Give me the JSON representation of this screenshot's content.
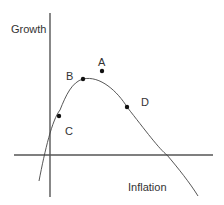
{
  "diagram": {
    "axes": {
      "y_label": "Growth",
      "x_label": "Inflation"
    },
    "points": [
      {
        "label": "A"
      },
      {
        "label": "B"
      },
      {
        "label": "C"
      },
      {
        "label": "D"
      }
    ],
    "colors": {
      "axis": "#555555",
      "curve": "#444444",
      "point": "#111111",
      "text": "#333333"
    }
  }
}
